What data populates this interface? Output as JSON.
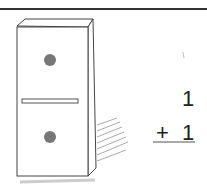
{
  "illustration": {
    "subject": "domino",
    "top_pips": 1,
    "bottom_pips": 1
  },
  "equation": {
    "addend1": "1",
    "operator": "+",
    "addend2": "1"
  }
}
